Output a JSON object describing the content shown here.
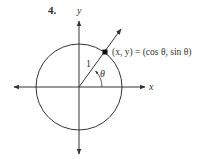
{
  "problem_number": "4.",
  "axes": {
    "x_label": "x",
    "y_label": "y"
  },
  "radius_label": "1",
  "angle_label": "θ",
  "point_label": "(x, y) = (cos θ, sin θ)",
  "colors": {
    "stroke": "#333333",
    "background": "#ffffff"
  }
}
